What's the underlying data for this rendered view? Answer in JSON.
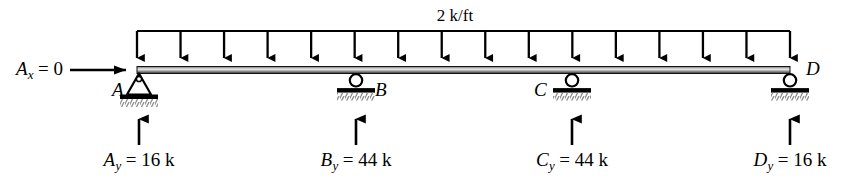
{
  "diagram": {
    "type": "beam-free-body-diagram",
    "title_visible": false,
    "colors": {
      "ink": "#000000",
      "beam_fill": "#8a8a8a",
      "beam_highlight": "#d9d9d9",
      "hatch": "#9a9a9a",
      "background": "#ffffff"
    },
    "beam": {
      "x_start": 137,
      "x_end": 790,
      "y": 70,
      "thickness": 7
    },
    "distributed_load": {
      "magnitude_label": "2 k/ft",
      "value": 2,
      "units": "k/ft",
      "arrow_count": 16,
      "header_line_y": 31,
      "arrow_tip_y": 66,
      "direction": "down",
      "x_from": 137,
      "x_to": 790
    },
    "horizontal_reaction": {
      "label_main": "A",
      "label_sub": "x",
      "label_rest": " = 0",
      "full_text": "Ax = 0",
      "value": 0,
      "units": "",
      "arrow_direction": "right",
      "arrow_x_from": 70,
      "arrow_x_to": 131,
      "arrow_y": 70
    },
    "supports": [
      {
        "id": "A",
        "label": "A",
        "kind": "pin",
        "x": 139,
        "label_x": 112,
        "label_y": 79
      },
      {
        "id": "B",
        "label": "B",
        "kind": "roller",
        "x": 356,
        "label_x": 375,
        "label_y": 79
      },
      {
        "id": "C",
        "label": "C",
        "kind": "roller",
        "x": 572,
        "label_x": 534,
        "label_y": 79
      },
      {
        "id": "D",
        "label": "D",
        "kind": "roller",
        "x": 790,
        "label_x": 806,
        "label_y": 58
      }
    ],
    "reactions": [
      {
        "id": "Ay",
        "label_main": "A",
        "label_sub": "y",
        "label_rest": " = 16 k",
        "full_text": "Ay = 16 k",
        "value": 16,
        "units": "k",
        "direction": "up",
        "arrow_x": 139,
        "arrow_y_bottom": 145,
        "arrow_y_top": 110,
        "text_x": 139,
        "text_y": 149
      },
      {
        "id": "By",
        "label_main": "B",
        "label_sub": "y",
        "label_rest": " = 44 k",
        "full_text": "By = 44 k",
        "value": 44,
        "units": "k",
        "direction": "up",
        "arrow_x": 356,
        "arrow_y_bottom": 145,
        "arrow_y_top": 110,
        "text_x": 356,
        "text_y": 149
      },
      {
        "id": "Cy",
        "label_main": "C",
        "label_sub": "y",
        "label_rest": " = 44 k",
        "full_text": "Cy = 44 k",
        "value": 44,
        "units": "k",
        "direction": "up",
        "arrow_x": 572,
        "arrow_y_bottom": 145,
        "arrow_y_top": 110,
        "text_x": 572,
        "text_y": 149
      },
      {
        "id": "Dy",
        "label_main": "D",
        "label_sub": "y",
        "label_rest": " = 16 k",
        "full_text": "Dy = 16 k",
        "value": 16,
        "units": "k",
        "direction": "up",
        "arrow_x": 790,
        "arrow_y_bottom": 145,
        "arrow_y_top": 110,
        "text_x": 790,
        "text_y": 149
      }
    ],
    "load_label_position": {
      "x": 455,
      "y": 6
    }
  }
}
